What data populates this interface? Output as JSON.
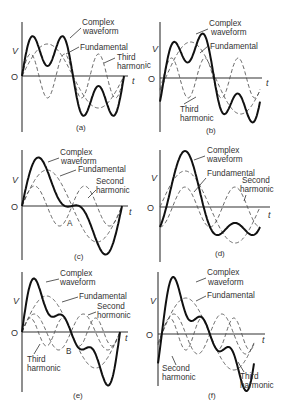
{
  "figure": {
    "panels": [
      {
        "id": "a",
        "caption": "(a)",
        "axis": {
          "x0": 22,
          "yTop": 22,
          "yBottom": 132,
          "yAxis": 76,
          "xEnd": 128,
          "v_label": "V",
          "t_label": "t",
          "origin_label": "O",
          "v_label_pos": [
            12,
            54
          ],
          "origin_pos": [
            11,
            80
          ],
          "t_pos": [
            132,
            84
          ],
          "caption_pos": [
            76,
            130
          ]
        },
        "period_px": 102,
        "components": [
          {
            "name": "Fundamental",
            "amp": 32,
            "harmonic": 1,
            "phase": 0,
            "dashed": true
          },
          {
            "name": "Third harmonic",
            "amp": 22,
            "harmonic": 3,
            "phase": 0,
            "dashed": true
          }
        ],
        "complex_scale": 1.0,
        "labels": [
          {
            "text": "Complex",
            "x": 82,
            "y": 25
          },
          {
            "text": "waveform",
            "x": 83,
            "y": 34
          },
          {
            "text": "Fundamental",
            "x": 80,
            "y": 50
          },
          {
            "text": "Third",
            "x": 117,
            "y": 60
          },
          {
            "text": "harmon",
            "x": 117,
            "y": 69
          }
        ],
        "leaders": [
          [
            81,
            28,
            70,
            38
          ],
          [
            79,
            47,
            66,
            54
          ],
          [
            115,
            58,
            104,
            63
          ]
        ],
        "point_labels": []
      },
      {
        "id": "b",
        "caption": "(b)",
        "axis": {
          "x0": 160,
          "yTop": 22,
          "yBottom": 132,
          "yAxis": 78,
          "xEnd": 262,
          "v_label": "V",
          "t_label": "t",
          "origin_label": "O",
          "v_label_pos": [
            152,
            52
          ],
          "origin_pos": [
            148,
            82
          ],
          "t_pos": [
            266,
            86
          ],
          "caption_pos": [
            206,
            133
          ]
        },
        "period_px": 100,
        "components": [
          {
            "name": "Fundamental",
            "amp": 36,
            "harmonic": 1,
            "phase": -0.35,
            "dashed": true
          },
          {
            "name": "Third harmonic",
            "amp": 20,
            "harmonic": 3,
            "phase": -0.6,
            "dashed": true
          }
        ],
        "complex_scale": 1.0,
        "labels": [
          {
            "text": "Complex",
            "x": 209,
            "y": 26
          },
          {
            "text": "waveform",
            "x": 211,
            "y": 35
          },
          {
            "text": "Fundamental",
            "x": 210,
            "y": 49
          },
          {
            "text": "Third",
            "x": 180,
            "y": 112
          },
          {
            "text": "harmonic",
            "x": 180,
            "y": 121
          },
          {
            "text": "ic",
            "x": 145,
            "y": 68
          }
        ],
        "leaders": [
          [
            208,
            29,
            196,
            34
          ],
          [
            208,
            46,
            200,
            53
          ],
          [
            184,
            104,
            196,
            97
          ]
        ],
        "point_labels": []
      },
      {
        "id": "c",
        "caption": "(c)",
        "axis": {
          "x0": 22,
          "yTop": 150,
          "yBottom": 260,
          "yAxis": 206,
          "xEnd": 128,
          "v_label": "V",
          "t_label": "t",
          "origin_label": "O",
          "v_label_pos": [
            12,
            183
          ],
          "origin_pos": [
            11,
            210
          ],
          "t_pos": [
            129,
            215
          ],
          "caption_pos": [
            74,
            259
          ]
        },
        "period_px": 100,
        "components": [
          {
            "name": "Fundamental",
            "amp": 36,
            "harmonic": 1,
            "phase": 0,
            "dashed": true
          },
          {
            "name": "Second harmonic",
            "amp": 20,
            "harmonic": 2,
            "phase": 0,
            "dashed": true
          }
        ],
        "complex_scale": 1.0,
        "labels": [
          {
            "text": "Complex",
            "x": 60,
            "y": 155
          },
          {
            "text": "waveform",
            "x": 61,
            "y": 164
          },
          {
            "text": "Fundamental",
            "x": 78,
            "y": 172
          },
          {
            "text": "Second",
            "x": 96,
            "y": 184
          },
          {
            "text": "harmonic",
            "x": 96,
            "y": 193
          }
        ],
        "leaders": [
          [
            59,
            158,
            48,
            162
          ],
          [
            76,
            170,
            60,
            176
          ],
          [
            96,
            190,
            88,
            198
          ]
        ],
        "point_labels": [
          {
            "text": "A",
            "x": 67,
            "y": 226
          }
        ]
      },
      {
        "id": "d",
        "caption": "(d)",
        "axis": {
          "x0": 160,
          "yTop": 150,
          "yBottom": 262,
          "yAxis": 207,
          "xEnd": 270,
          "v_label": "V",
          "t_label": "t",
          "origin_label": "O",
          "v_label_pos": [
            151,
            181
          ],
          "origin_pos": [
            147,
            211
          ],
          "t_pos": [
            268,
            218
          ],
          "caption_pos": [
            215,
            256
          ]
        },
        "period_px": 100,
        "components": [
          {
            "name": "Fundamental",
            "amp": 36,
            "harmonic": 1,
            "phase": 0,
            "dashed": true
          },
          {
            "name": "Second harmonic",
            "amp": 20,
            "harmonic": 2,
            "phase": -1.5708,
            "dashed": true
          }
        ],
        "complex_scale": 1.0,
        "labels": [
          {
            "text": "Complex",
            "x": 207,
            "y": 153
          },
          {
            "text": "waveform",
            "x": 207,
            "y": 162
          },
          {
            "text": "Fundamental",
            "x": 207,
            "y": 176
          },
          {
            "text": "Second",
            "x": 242,
            "y": 183
          },
          {
            "text": "harmonic",
            "x": 240,
            "y": 192
          }
        ],
        "leaders": [
          [
            205,
            156,
            194,
            160
          ],
          [
            206,
            178,
            194,
            192
          ],
          [
            246,
            195,
            244,
            201
          ]
        ],
        "point_labels": []
      },
      {
        "id": "e",
        "caption": "(e)",
        "axis": {
          "x0": 22,
          "yTop": 272,
          "yBottom": 392,
          "yAxis": 332,
          "xEnd": 128,
          "v_label": "V",
          "t_label": "t",
          "origin_label": "O",
          "v_label_pos": [
            13,
            304
          ],
          "origin_pos": [
            11,
            336
          ],
          "t_pos": [
            125,
            341
          ],
          "caption_pos": [
            73,
            398
          ]
        },
        "period_px": 98,
        "components": [
          {
            "name": "Fundamental",
            "amp": 36,
            "harmonic": 1,
            "phase": 0,
            "dashed": true
          },
          {
            "name": "Second harmonic",
            "amp": 18,
            "harmonic": 2,
            "phase": 0,
            "dashed": true
          },
          {
            "name": "Third harmonic",
            "amp": 14,
            "harmonic": 3,
            "phase": 0,
            "dashed": true
          }
        ],
        "complex_scale": 1.0,
        "labels": [
          {
            "text": "Complex",
            "x": 60,
            "y": 276
          },
          {
            "text": "waveform",
            "x": 60,
            "y": 285
          },
          {
            "text": "Fundamental",
            "x": 79,
            "y": 299
          },
          {
            "text": "Second",
            "x": 97,
            "y": 309
          },
          {
            "text": "hormonic",
            "x": 97,
            "y": 318
          },
          {
            "text": "Third",
            "x": 27,
            "y": 362
          },
          {
            "text": "harmonic",
            "x": 27,
            "y": 371
          }
        ],
        "leaders": [
          [
            59,
            279,
            46,
            282
          ],
          [
            78,
            297,
            62,
            302
          ],
          [
            96,
            312,
            88,
            315
          ],
          [
            34,
            354,
            40,
            344
          ]
        ],
        "point_labels": [
          {
            "text": "B",
            "x": 66,
            "y": 354
          }
        ]
      },
      {
        "id": "f",
        "caption": "(f)",
        "axis": {
          "x0": 158,
          "yTop": 272,
          "yBottom": 386,
          "yAxis": 334,
          "xEnd": 265,
          "v_label": "V",
          "t_label": "t",
          "origin_label": "O",
          "v_label_pos": [
            150,
            304
          ],
          "origin_pos": [
            146,
            338
          ],
          "t_pos": [
            262,
            343
          ],
          "caption_pos": [
            208,
            398
          ]
        },
        "period_px": 96,
        "components": [
          {
            "name": "Fundamental",
            "amp": 36,
            "harmonic": 1,
            "phase": -0.25,
            "dashed": true
          },
          {
            "name": "Second harmonic",
            "amp": 20,
            "harmonic": 2,
            "phase": -0.5,
            "dashed": true
          },
          {
            "name": "Third harmonic",
            "amp": 16,
            "harmonic": 3,
            "phase": -0.75,
            "dashed": true
          }
        ],
        "complex_scale": 1.0,
        "labels": [
          {
            "text": "Complex",
            "x": 207,
            "y": 275
          },
          {
            "text": "waveform",
            "x": 208,
            "y": 285
          },
          {
            "text": "Fundamental",
            "x": 207,
            "y": 298
          },
          {
            "text": "Second",
            "x": 162,
            "y": 371
          },
          {
            "text": "harmonic",
            "x": 162,
            "y": 380
          },
          {
            "text": "Third",
            "x": 240,
            "y": 379
          },
          {
            "text": "harmonic",
            "x": 240,
            "y": 388
          }
        ],
        "leaders": [
          [
            206,
            278,
            196,
            282
          ],
          [
            206,
            296,
            196,
            301
          ],
          [
            176,
            365,
            172,
            356
          ],
          [
            244,
            372,
            238,
            362
          ]
        ],
        "point_labels": []
      }
    ]
  }
}
